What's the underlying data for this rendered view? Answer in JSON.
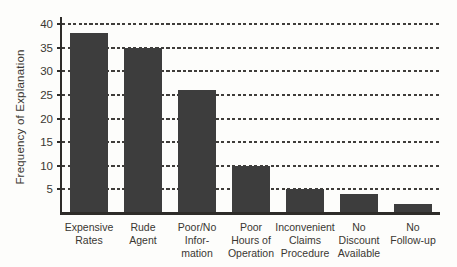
{
  "chart_data": {
    "type": "bar",
    "title": "",
    "xlabel": "",
    "ylabel": "Frequency of Explanation",
    "categories": [
      [
        "Expensive",
        "Rates"
      ],
      [
        "Rude",
        "Agent"
      ],
      [
        "Poor/No",
        "Infor-",
        "mation"
      ],
      [
        "Poor",
        "Hours of",
        "Operation"
      ],
      [
        "Inconvenient",
        "Claims",
        "Procedure"
      ],
      [
        "No",
        "Discount",
        "Available"
      ],
      [
        "No",
        "Follow-up"
      ]
    ],
    "values": [
      38,
      35,
      26,
      10,
      5,
      4,
      2
    ],
    "yticks": [
      5,
      10,
      15,
      20,
      25,
      30,
      35,
      40
    ],
    "ylim": [
      0,
      40
    ],
    "grid": "dashed-horizontal",
    "legend": "none",
    "colors": {
      "bar": "#3d3d3d",
      "axis": "#2e2c29",
      "gridline": "#3f3d3a",
      "text": "#3a3732",
      "background": "#fdfdfb"
    }
  }
}
